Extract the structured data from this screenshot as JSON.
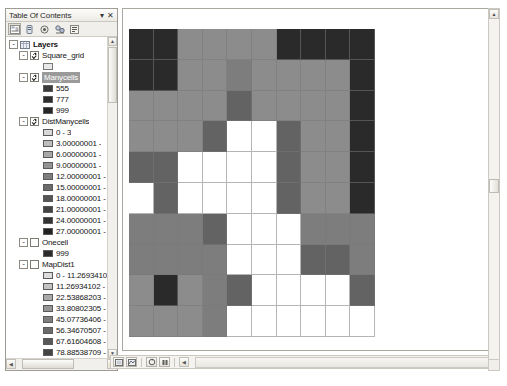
{
  "toc": {
    "title": "Table Of Contents",
    "pin_label": "▾",
    "close_label": "✕",
    "toolbar": [
      {
        "name": "list-by-drawing-order-icon",
        "label": ""
      },
      {
        "name": "list-by-source-icon",
        "label": ""
      },
      {
        "name": "list-by-visibility-icon",
        "label": ""
      },
      {
        "name": "list-by-selection-icon",
        "label": ""
      },
      {
        "name": "options-icon",
        "label": ""
      }
    ],
    "tree": [
      {
        "name": "layers-root",
        "label": "Layers",
        "indent": 1,
        "expander": "-",
        "checkbox": "none",
        "bold": true,
        "selected": false,
        "icon": "dataframe-icon"
      },
      {
        "name": "layer-square-grid",
        "label": "Square_grid",
        "indent": 2,
        "expander": "-",
        "checkbox": "checked",
        "bold": false,
        "selected": false,
        "icon": ""
      },
      {
        "name": "symbol-square-grid-outline",
        "label": "",
        "indent": 3,
        "expander": "none",
        "checkbox": "none",
        "swatch": "#e8e8e8",
        "swatch_border": "#7a7a7a"
      },
      {
        "name": "layer-manycells",
        "label": "Manycells",
        "indent": 2,
        "expander": "-",
        "checkbox": "checked",
        "bold": false,
        "selected": true,
        "icon": ""
      },
      {
        "name": "legend-manycells-555",
        "label": "555",
        "indent": 3,
        "expander": "none",
        "checkbox": "none",
        "swatch": "#3a3a3a"
      },
      {
        "name": "legend-manycells-777",
        "label": "777",
        "indent": 3,
        "expander": "none",
        "checkbox": "none",
        "swatch": "#2e2e2e"
      },
      {
        "name": "legend-manycells-999",
        "label": "999",
        "indent": 3,
        "expander": "none",
        "checkbox": "none",
        "swatch": "#262626"
      },
      {
        "name": "layer-distmanycells",
        "label": "DistManycells",
        "indent": 2,
        "expander": "-",
        "checkbox": "checked",
        "bold": false,
        "selected": false,
        "icon": ""
      },
      {
        "name": "legend-dist-0",
        "label": "0 - 3",
        "indent": 3,
        "expander": "none",
        "checkbox": "none",
        "swatch": "#d8d8d8"
      },
      {
        "name": "legend-dist-1",
        "label": "3.00000001 -",
        "indent": 3,
        "expander": "none",
        "checkbox": "none",
        "swatch": "#bdbdbd"
      },
      {
        "name": "legend-dist-2",
        "label": "6.00000001 -",
        "indent": 3,
        "expander": "none",
        "checkbox": "none",
        "swatch": "#a8a8a8"
      },
      {
        "name": "legend-dist-3",
        "label": "9.00000001 -",
        "indent": 3,
        "expander": "none",
        "checkbox": "none",
        "swatch": "#949494"
      },
      {
        "name": "legend-dist-4",
        "label": "12.00000001 -",
        "indent": 3,
        "expander": "none",
        "checkbox": "none",
        "swatch": "#7e7e7e"
      },
      {
        "name": "legend-dist-5",
        "label": "15.00000001 -",
        "indent": 3,
        "expander": "none",
        "checkbox": "none",
        "swatch": "#6a6a6a"
      },
      {
        "name": "legend-dist-6",
        "label": "18.00000001 -",
        "indent": 3,
        "expander": "none",
        "checkbox": "none",
        "swatch": "#565656"
      },
      {
        "name": "legend-dist-7",
        "label": "21.00000001 -",
        "indent": 3,
        "expander": "none",
        "checkbox": "none",
        "swatch": "#434343"
      },
      {
        "name": "legend-dist-8",
        "label": "24.00000001 -",
        "indent": 3,
        "expander": "none",
        "checkbox": "none",
        "swatch": "#333333"
      },
      {
        "name": "legend-dist-9",
        "label": "27.00000001 -",
        "indent": 3,
        "expander": "none",
        "checkbox": "none",
        "swatch": "#222222"
      },
      {
        "name": "layer-onecell",
        "label": "Onecell",
        "indent": 2,
        "expander": "-",
        "checkbox": "unchecked",
        "bold": false,
        "selected": false,
        "icon": ""
      },
      {
        "name": "legend-onecell-999",
        "label": "999",
        "indent": 3,
        "expander": "none",
        "checkbox": "none",
        "swatch": "#2b2b2b"
      },
      {
        "name": "layer-mapdist1",
        "label": "MapDist1",
        "indent": 2,
        "expander": "-",
        "checkbox": "unchecked",
        "bold": false,
        "selected": false,
        "icon": ""
      },
      {
        "name": "legend-mapdist-0",
        "label": "0 - 11.2693410",
        "indent": 3,
        "expander": "none",
        "checkbox": "none",
        "swatch": "#dcdcdc"
      },
      {
        "name": "legend-mapdist-1",
        "label": "11.26934102 -",
        "indent": 3,
        "expander": "none",
        "checkbox": "none",
        "swatch": "#c2c2c2"
      },
      {
        "name": "legend-mapdist-2",
        "label": "22.53868203 -",
        "indent": 3,
        "expander": "none",
        "checkbox": "none",
        "swatch": "#ababab"
      },
      {
        "name": "legend-mapdist-3",
        "label": "33.80802305 -",
        "indent": 3,
        "expander": "none",
        "checkbox": "none",
        "swatch": "#959595"
      },
      {
        "name": "legend-mapdist-4",
        "label": "45.07736406 -",
        "indent": 3,
        "expander": "none",
        "checkbox": "none",
        "swatch": "#7f7f7f"
      },
      {
        "name": "legend-mapdist-5",
        "label": "56.34670507 -",
        "indent": 3,
        "expander": "none",
        "checkbox": "none",
        "swatch": "#6b6b6b"
      },
      {
        "name": "legend-mapdist-6",
        "label": "67.61604608 -",
        "indent": 3,
        "expander": "none",
        "checkbox": "none",
        "swatch": "#575757"
      },
      {
        "name": "legend-mapdist-7",
        "label": "78.88538709 -",
        "indent": 3,
        "expander": "none",
        "checkbox": "none",
        "swatch": "#444444"
      },
      {
        "name": "legend-mapdist-8",
        "label": "90.1547281 - 1",
        "indent": 3,
        "expander": "none",
        "checkbox": "none",
        "swatch": "#303030"
      },
      {
        "name": "legend-mapdist-9",
        "label": "101.4240692 -",
        "indent": 3,
        "expander": "none",
        "checkbox": "none",
        "swatch": "#1f1f1f"
      }
    ]
  },
  "map": {
    "bottom_toolbar": [
      {
        "name": "layout-view-icon"
      },
      {
        "name": "data-view-icon"
      },
      {
        "name": "refresh-icon"
      },
      {
        "name": "pause-drawing-icon"
      }
    ]
  },
  "palette": {
    "dark": "#2a2a2a",
    "mid_dark": "#636363",
    "mid": "#7d7d7d",
    "light": "#8c8c8c",
    "white": "#ffffff",
    "grid_line": "#787878"
  },
  "chart_data": {
    "type": "heatmap",
    "title": "",
    "xlabel": "",
    "ylabel": "",
    "ncols": 10,
    "nrows": 10,
    "colorscale": {
      "dark": "#2a2a2a",
      "mid_dark": "#636363",
      "mid": "#7d7d7d",
      "light": "#8c8c8c",
      "white": "#ffffff"
    },
    "cells": [
      [
        "dark",
        "dark",
        "light",
        "light",
        "light",
        "light",
        "dark",
        "dark",
        "dark",
        "dark"
      ],
      [
        "dark",
        "dark",
        "light",
        "light",
        "mid",
        "light",
        "light",
        "light",
        "light",
        "dark"
      ],
      [
        "light",
        "light",
        "light",
        "light",
        "mid_dark",
        "light",
        "light",
        "light",
        "light",
        "dark"
      ],
      [
        "light",
        "light",
        "light",
        "mid_dark",
        "white",
        "white",
        "mid_dark",
        "light",
        "light",
        "dark"
      ],
      [
        "mid_dark",
        "mid_dark",
        "white",
        "white",
        "white",
        "white",
        "mid_dark",
        "light",
        "light",
        "dark"
      ],
      [
        "white",
        "mid_dark",
        "white",
        "white",
        "white",
        "white",
        "mid_dark",
        "light",
        "light",
        "dark"
      ],
      [
        "mid",
        "mid",
        "mid",
        "mid_dark",
        "white",
        "white",
        "white",
        "mid",
        "mid",
        "mid"
      ],
      [
        "mid",
        "mid",
        "mid",
        "mid",
        "white",
        "white",
        "white",
        "mid_dark",
        "mid_dark",
        "mid"
      ],
      [
        "light",
        "dark",
        "light",
        "mid",
        "mid_dark",
        "white",
        "white",
        "white",
        "white",
        "mid_dark"
      ],
      [
        "light",
        "light",
        "light",
        "mid",
        "white",
        "white",
        "white",
        "white",
        "white",
        "white"
      ]
    ]
  }
}
